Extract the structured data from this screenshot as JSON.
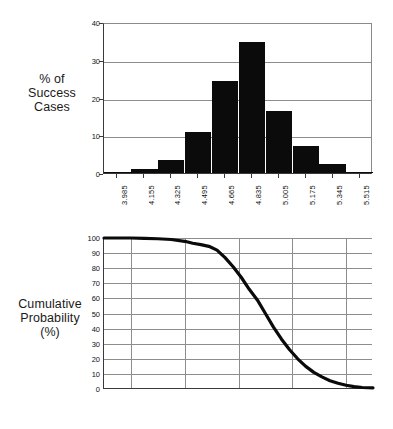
{
  "figure": {
    "background": "#ffffff",
    "ink_color": "#000000",
    "grid_color": "#8d8d8d"
  },
  "chart_data": [
    {
      "id": "histogram",
      "type": "bar",
      "title": "",
      "ylabel": "% of Success Cases",
      "ylabel_lines": [
        "% of",
        "Success",
        "Cases"
      ],
      "xlabel": "",
      "categories": [
        "3.985",
        "4.155",
        "4.325",
        "4.495",
        "4.665",
        "4.835",
        "5.005",
        "5.175",
        "5.345",
        "5.515"
      ],
      "values": [
        0.4,
        1.1,
        3.4,
        10.9,
        24.5,
        34.6,
        16.5,
        7.2,
        2.5,
        0.1
      ],
      "yticks": [
        0,
        10,
        20,
        30,
        40
      ],
      "ytick_labels": [
        "0",
        "10",
        "20",
        "30",
        "40"
      ],
      "ylim": [
        0,
        40
      ],
      "grid": "horizontal",
      "legend": "none"
    },
    {
      "id": "cumulative",
      "type": "line",
      "title": "",
      "ylabel": "Cumulative Probability (%)",
      "ylabel_lines": [
        "Cumulative",
        "Probability",
        "(%)"
      ],
      "xlabel": "",
      "xtick_labels": [
        "3.9",
        "4.1",
        "4.3",
        "4.4",
        "4.6",
        "4.8",
        "5.0",
        "5.2",
        "5.3",
        "5.5",
        "5.7"
      ],
      "x": [
        3.9,
        4.1,
        4.3,
        4.4,
        4.6,
        4.8,
        5.0,
        5.2,
        5.3,
        5.5,
        5.7
      ],
      "values": [
        100,
        100,
        99,
        96,
        88,
        52,
        22,
        8,
        4,
        1,
        0
      ],
      "curve_points": [
        [
          0.0,
          100
        ],
        [
          5.0,
          100
        ],
        [
          10.0,
          100
        ],
        [
          15.0,
          99.8
        ],
        [
          20.0,
          99.5
        ],
        [
          25.0,
          99.0
        ],
        [
          30.0,
          97.8
        ],
        [
          33.0,
          96.5
        ],
        [
          36.0,
          95.6
        ],
        [
          39.0,
          94.5
        ],
        [
          42.0,
          92.0
        ],
        [
          45.0,
          87.0
        ],
        [
          48.0,
          81.0
        ],
        [
          51.0,
          74.0
        ],
        [
          54.0,
          66.0
        ],
        [
          57.0,
          59.0
        ],
        [
          60.0,
          50.0
        ],
        [
          63.0,
          41.0
        ],
        [
          66.0,
          33.0
        ],
        [
          69.0,
          26.0
        ],
        [
          72.0,
          20.0
        ],
        [
          75.0,
          15.0
        ],
        [
          78.0,
          11.0
        ],
        [
          81.0,
          8.0
        ],
        [
          84.0,
          5.5
        ],
        [
          87.0,
          3.8
        ],
        [
          90.0,
          2.5
        ],
        [
          93.0,
          1.6
        ],
        [
          96.0,
          1.0
        ],
        [
          100.0,
          0.8
        ]
      ],
      "yticks": [
        0,
        10,
        20,
        30,
        40,
        50,
        60,
        70,
        80,
        90,
        100
      ],
      "ytick_labels": [
        "0",
        "10",
        "20",
        "30",
        "40",
        "50",
        "60",
        "70",
        "80",
        "90",
        "100"
      ],
      "ylim": [
        0,
        100
      ],
      "grid": "both",
      "legend": "none"
    }
  ]
}
